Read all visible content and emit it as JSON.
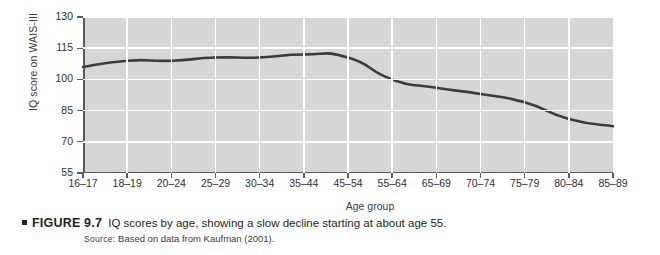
{
  "figure": {
    "bullet": "▪",
    "number_label": "FIGURE 9.7",
    "caption_text": "IQ scores by age, showing a slow decline starting at about age 55.",
    "source_label": "Source:",
    "source_text": "Based on data from Kaufman (2001)."
  },
  "colors": {
    "plot_background": "#d6d6d6",
    "gridline": "#ffffff",
    "series_line": "#3b3b3b",
    "axis": "#5a5a5a",
    "text": "#231f20"
  },
  "chart_data": {
    "type": "line",
    "title": "",
    "xlabel": "Age group",
    "ylabel": "IQ score on WAIS-III",
    "ylim": [
      55,
      130
    ],
    "yticks": [
      55,
      70,
      85,
      100,
      115,
      130
    ],
    "grid": true,
    "legend": "none",
    "categories": [
      "16–17",
      "18–19",
      "20–24",
      "25–29",
      "30–34",
      "35–44",
      "45–54",
      "55–64",
      "65–69",
      "70–74",
      "75–79",
      "80–84",
      "85–89"
    ],
    "series": [
      {
        "name": "IQ score on WAIS-III",
        "values": [
          106,
          109,
          109,
          110.5,
          110.5,
          112,
          110.5,
          100,
          96,
          93,
          89,
          81,
          77.5
        ]
      }
    ]
  }
}
